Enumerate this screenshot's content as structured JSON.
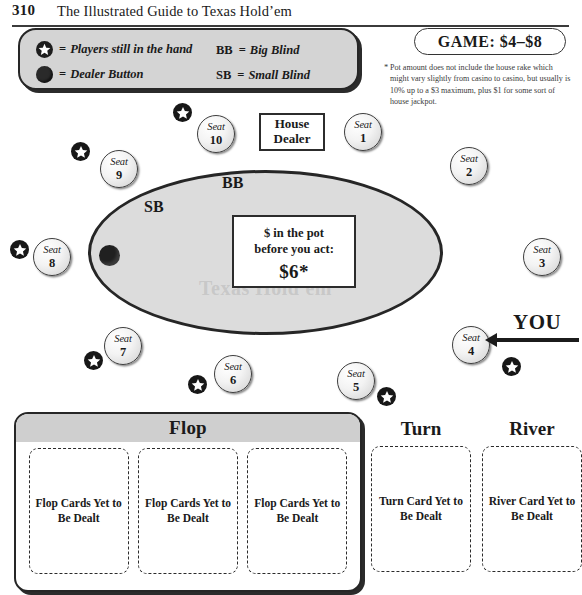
{
  "running_head": {
    "page_number": "310",
    "book_title": "The Illustrated Guide to Texas Hold’em"
  },
  "legend": {
    "players_eq": "=",
    "players_label": "Players still in the hand",
    "dealer_eq": "=",
    "dealer_label": "Dealer Button",
    "bb_code": "BB",
    "bb_eq": "=",
    "bb_label": "Big Blind",
    "sb_code": "SB",
    "sb_eq": "=",
    "sb_label": "Small Blind",
    "star_icon": "star-icon",
    "dealer_icon": "dealer-button-icon"
  },
  "game_banner": {
    "label": "GAME: $4–$8"
  },
  "footnote": {
    "marker": "*",
    "text": "Pot amount does not include the house rake which might vary slightly from casino to casino, but usually is 10% up to a $3 maximum, plus $1 for some sort of house jackpot."
  },
  "table": {
    "watermark": "Texas Hold'em",
    "bb_marker": "BB",
    "sb_marker": "SB",
    "house_dealer": {
      "line1": "House",
      "line2": "Dealer"
    },
    "pot": {
      "line1": "$ in the pot",
      "line2": "before you act:",
      "amount": "$6*"
    },
    "seat_word": "Seat",
    "seats": [
      {
        "number": "1",
        "x": 344,
        "y": 113
      },
      {
        "number": "2",
        "x": 450,
        "y": 147
      },
      {
        "number": "3",
        "x": 523,
        "y": 238
      },
      {
        "number": "4",
        "x": 452,
        "y": 326
      },
      {
        "number": "5",
        "x": 337,
        "y": 362
      },
      {
        "number": "6",
        "x": 214,
        "y": 355
      },
      {
        "number": "7",
        "x": 104,
        "y": 327
      },
      {
        "number": "8",
        "x": 33,
        "y": 238
      },
      {
        "number": "9",
        "x": 100,
        "y": 150
      },
      {
        "number": "10",
        "x": 197,
        "y": 115
      }
    ],
    "player_stars": [
      {
        "x": 173,
        "y": 103
      },
      {
        "x": 71,
        "y": 142
      },
      {
        "x": 10,
        "y": 240
      },
      {
        "x": 84,
        "y": 351
      },
      {
        "x": 188,
        "y": 375
      },
      {
        "x": 377,
        "y": 387
      },
      {
        "x": 502,
        "y": 357
      }
    ]
  },
  "you_pointer": {
    "label": "YOU"
  },
  "board": {
    "flop": {
      "header": "Flop",
      "cards": [
        "Flop Cards Yet to Be Dealt",
        "Flop Cards Yet to Be Dealt",
        "Flop Cards Yet to Be Dealt"
      ]
    },
    "turn": {
      "header": "Turn",
      "card": "Turn Card Yet to Be Dealt"
    },
    "river": {
      "header": "River",
      "card": "River Card Yet to Be Dealt"
    }
  },
  "colors": {
    "ink": "#1a1a1a",
    "felt": "#dcdcdc",
    "panel_header": "#cfcfcf",
    "legend_fill": "#d4d4d4"
  }
}
